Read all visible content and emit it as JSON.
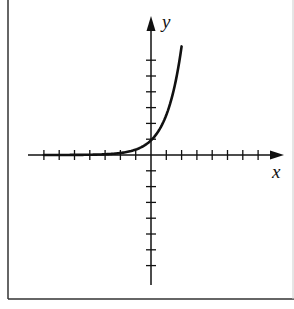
{
  "chart_data": {
    "type": "line",
    "title": "",
    "xlabel": "x",
    "ylabel": "y",
    "function": "y = e^x",
    "xlim": [
      -7.5,
      8.5
    ],
    "ylim": [
      -8.5,
      8.7
    ],
    "x_ticks": [
      -7,
      -6,
      -5,
      -4,
      -3,
      -2,
      -1,
      1,
      2,
      3,
      4,
      5,
      6,
      7
    ],
    "y_ticks": [
      -7,
      -6,
      -5,
      -4,
      -3,
      -2,
      -1,
      1,
      2,
      3,
      4,
      5,
      6
    ],
    "tick_labels_shown": false,
    "grid": false,
    "legend": null,
    "series": [
      {
        "name": "curve",
        "x": [
          -7,
          -6,
          -5,
          -4,
          -3,
          -2,
          -1,
          0,
          0.5,
          1,
          1.5,
          2
        ],
        "y": [
          0.001,
          0.002,
          0.007,
          0.018,
          0.05,
          0.135,
          0.368,
          1,
          1.65,
          2.72,
          4.48,
          7.39
        ]
      }
    ]
  },
  "axes": {
    "x_label": "x",
    "y_label": "y"
  },
  "colors": {
    "ink": "#111111",
    "border": "#333333",
    "background": "#ffffff"
  }
}
